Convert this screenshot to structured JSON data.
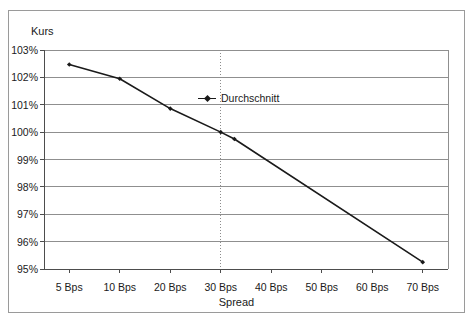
{
  "figure": {
    "border_color": "#9a9a9a",
    "background": "#ffffff"
  },
  "chart_data": {
    "type": "line",
    "title": "",
    "ylabel": "Kurs",
    "xlabel": "Spread",
    "grid": true,
    "legend_position": "inside-upper-center",
    "ylim": [
      95,
      103
    ],
    "ytick_labels": [
      "103%",
      "102%",
      "101%",
      "100%",
      "99%",
      "98%",
      "97%",
      "96%",
      "95%"
    ],
    "ytick_values": [
      103,
      102,
      101,
      100,
      99,
      98,
      97,
      96,
      95
    ],
    "xtick_labels": [
      "5 Bps",
      "10 Bps",
      "20 Bps",
      "30 Bps",
      "40 Bps",
      "50 Bps",
      "60 Bps",
      "70 Bps"
    ],
    "xtick_values": [
      5,
      10,
      20,
      30,
      40,
      50,
      60,
      70
    ],
    "series": [
      {
        "name": "Durchschnitt",
        "color": "#1a1a1a",
        "marker": "diamond",
        "x": [
          5,
          10,
          20,
          30,
          32.7,
          70
        ],
        "values": [
          102.47,
          101.95,
          100.86,
          100.0,
          99.75,
          95.25
        ]
      }
    ],
    "annotations": [
      {
        "type": "vertical-dotted-line",
        "x": 30,
        "label": "",
        "color": "#8c8c8c"
      }
    ]
  },
  "legend": {
    "entries": [
      {
        "label": "Durchschnitt"
      }
    ]
  }
}
